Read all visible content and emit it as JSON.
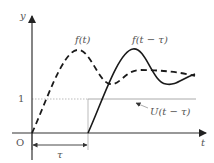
{
  "diagram": {
    "axes": {
      "x_label": "t",
      "y_label": "y",
      "origin_label": "O",
      "y_tick_label": "1"
    },
    "curves": {
      "original": {
        "label": "f(t)",
        "style": "dashed"
      },
      "shifted": {
        "label": "f(t − τ)",
        "style": "solid"
      },
      "step": {
        "label": "U(t − τ)",
        "style": "gray line"
      }
    },
    "shift": {
      "label": "τ"
    },
    "colors": {
      "curve": "#1a1a1a",
      "axis": "#333333",
      "guide": "#aaaaaa",
      "text": "#555555"
    }
  }
}
